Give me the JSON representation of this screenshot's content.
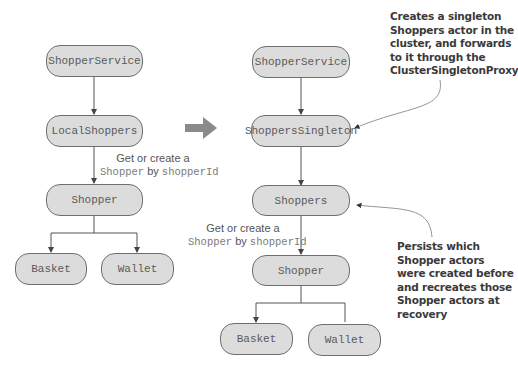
{
  "left_diagram": {
    "nodes": {
      "shopper_service": "ShopperService",
      "local_shoppers": "LocalShoppers",
      "shopper": "Shopper",
      "basket": "Basket",
      "wallet": "Wallet"
    },
    "edge_label": {
      "line1": "Get or create a",
      "mono1": "Shopper",
      "by": " by ",
      "mono2": "shopperId"
    }
  },
  "transition_arrow": {
    "icon": "right-arrow",
    "color": "#8a8a8a"
  },
  "right_diagram": {
    "nodes": {
      "shopper_service": "ShopperService",
      "shoppers_singleton": "ShoppersSingleton",
      "shoppers": "Shoppers",
      "shopper": "Shopper",
      "basket": "Basket",
      "wallet": "Wallet"
    },
    "edge_label": {
      "line1": "Get or create a",
      "mono1": "Shopper",
      "by": " by ",
      "mono2": "shopperId"
    }
  },
  "annotations": {
    "singleton_note": {
      "lines": [
        "Creates a singleton",
        "Shoppers actor in the",
        "cluster, and forwards",
        "to it through the",
        "ClusterSingletonProxy"
      ]
    },
    "persist_note": {
      "lines": [
        "Persists which",
        "Shopper actors",
        "were created before",
        "and recreates those",
        "Shopper actors at",
        "recovery"
      ]
    }
  },
  "colors": {
    "node_fill": "#dcdcdc",
    "node_border": "#6e6e6e",
    "line": "#555555",
    "annotation_line": "#888888"
  }
}
